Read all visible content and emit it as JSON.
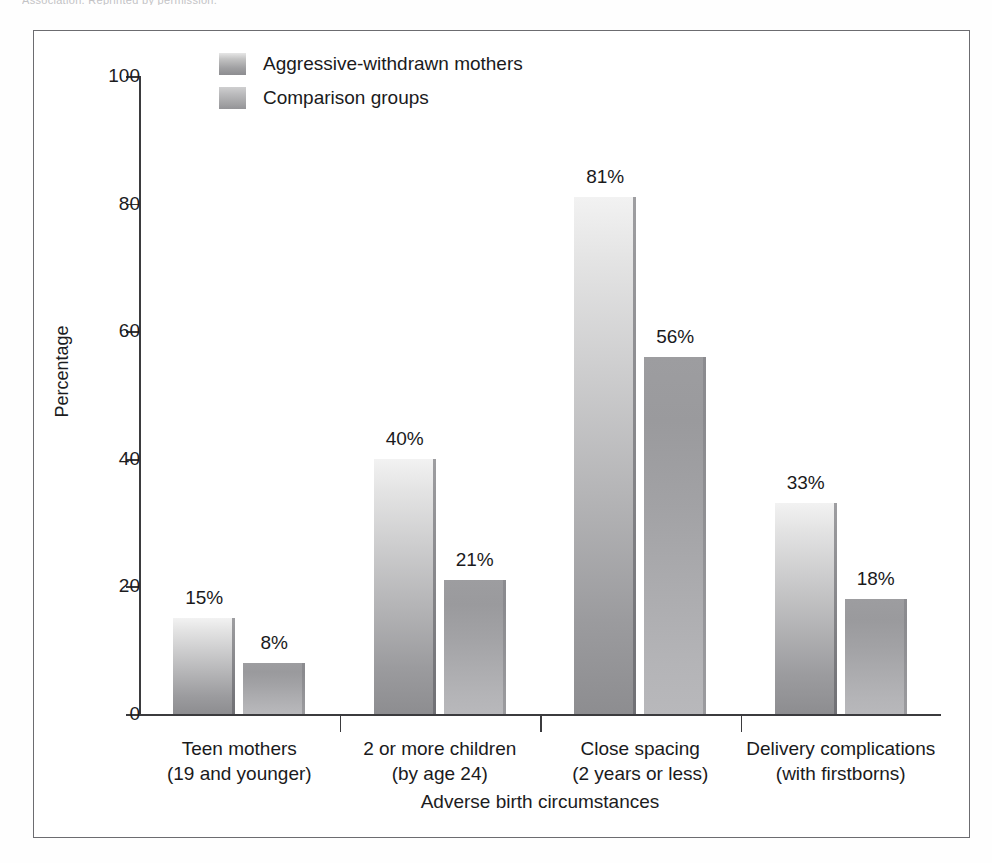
{
  "scan_fragment": "Association. Reprinted by permission.",
  "chart_data": {
    "type": "bar",
    "title": "",
    "xlabel": "Adverse birth circumstances",
    "ylabel": "Percentage",
    "ylim": [
      0,
      100
    ],
    "ytick_labels": [
      "100",
      "80",
      "60",
      "40",
      "20",
      "0"
    ],
    "yticks": [
      100,
      80,
      60,
      40,
      20,
      0
    ],
    "grid": false,
    "legend_position": "top-center",
    "value_suffix": "%",
    "categories": [
      {
        "line1": "Teen mothers",
        "line2": "(19 and younger)"
      },
      {
        "line1": "2 or more children",
        "line2": "(by age 24)"
      },
      {
        "line1": "Close spacing",
        "line2": "(2 years or less)"
      },
      {
        "line1": "Delivery complications",
        "line2": "(with firstborns)"
      }
    ],
    "series": [
      {
        "name": "Aggressive-withdrawn mothers",
        "color": "#c3c3c5",
        "values": [
          15,
          40,
          81,
          33
        ],
        "labels": [
          "15%",
          "40%",
          "81%",
          "33%"
        ]
      },
      {
        "name": "Comparison groups",
        "color": "#a6a6a9",
        "values": [
          8,
          21,
          56,
          18
        ],
        "labels": [
          "8%",
          "21%",
          "56%",
          "18%"
        ]
      }
    ]
  }
}
